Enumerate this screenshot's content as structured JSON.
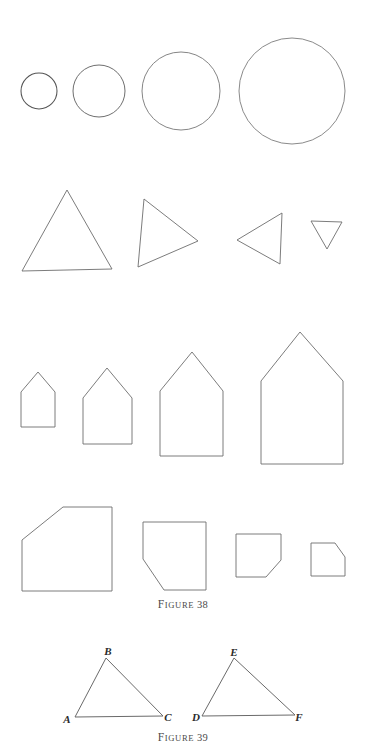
{
  "page": {
    "background": "#ffffff",
    "ink": "#6d6d6d",
    "ink_dark": "#2b2b2b",
    "width": 366,
    "height": 755
  },
  "figures": [
    {
      "id": "figure-38",
      "caption_first": "F",
      "caption_rest": "IGURE",
      "caption_number": "38",
      "caption_full": "FIGURE 38",
      "rows": [
        {
          "name": "circles-row",
          "shape": "circle",
          "items": [
            {
              "label": "circle-1",
              "cx": 39,
              "cy": 91,
              "r": 18
            },
            {
              "label": "circle-2",
              "cx": 99,
              "cy": 91,
              "r": 26
            },
            {
              "label": "circle-3",
              "cx": 181,
              "cy": 91,
              "r": 39
            },
            {
              "label": "circle-4",
              "cx": 292,
              "cy": 91,
              "r": 53
            }
          ]
        },
        {
          "name": "triangles-row",
          "shape": "triangle",
          "items": [
            {
              "label": "triangle-1-upright-large",
              "points": "22,271 67,190 112,269"
            },
            {
              "label": "triangle-2-right-pointing",
              "points": "144,199 198,241 138,267"
            },
            {
              "label": "triangle-3-left-pointing",
              "points": "282,213 237,240 280,264"
            },
            {
              "label": "triangle-4-down-pointing-small",
              "points": "311,221 342,222 327,249"
            }
          ]
        },
        {
          "name": "houses-row",
          "shape": "pentagon-house",
          "items": [
            {
              "label": "house-1",
              "points": "21,427 21,392 38,372 55,392 55,427"
            },
            {
              "label": "house-2",
              "points": "83,444 83,398 107,368 132,398 132,444"
            },
            {
              "label": "house-3",
              "points": "160,456 160,391 192,352 223,391 223,456"
            },
            {
              "label": "house-4",
              "points": "261,464 261,381 300,332 343,381 343,464"
            }
          ]
        },
        {
          "name": "beveled-quads-row",
          "shape": "pentagon-beveled",
          "items": [
            {
              "label": "bevel-1-large-top-left-cut",
              "points": "22,540 63,507 112,507 112,591 22,591"
            },
            {
              "label": "bevel-2-bottom-left-cut",
              "points": "143,522 206,522 206,590 164,590 143,559"
            },
            {
              "label": "bevel-3-bottom-right-cut",
              "points": "236,534 281,534 281,560 266,577 236,577"
            },
            {
              "label": "bevel-4-top-right-cut-small",
              "points": "311,543 335,543 345,557 345,576 311,576"
            }
          ]
        }
      ]
    },
    {
      "id": "figure-39",
      "caption_first": "F",
      "caption_rest": "IGURE",
      "caption_number": "39",
      "caption_full": "FIGURE 39",
      "triangles": [
        {
          "name": "triangle-ABC",
          "points": "75,717 106,658 163,716",
          "vertices": [
            {
              "label": "A",
              "x": 67,
              "y": 719
            },
            {
              "label": "B",
              "x": 108,
              "y": 651
            },
            {
              "label": "C",
              "x": 168,
              "y": 717
            }
          ]
        },
        {
          "name": "triangle-DEF",
          "points": "202,716 234,658 295,715",
          "vertices": [
            {
              "label": "D",
              "x": 196,
              "y": 717
            },
            {
              "label": "E",
              "x": 234,
              "y": 652
            },
            {
              "label": "F",
              "x": 299,
              "y": 717
            }
          ]
        }
      ]
    }
  ]
}
